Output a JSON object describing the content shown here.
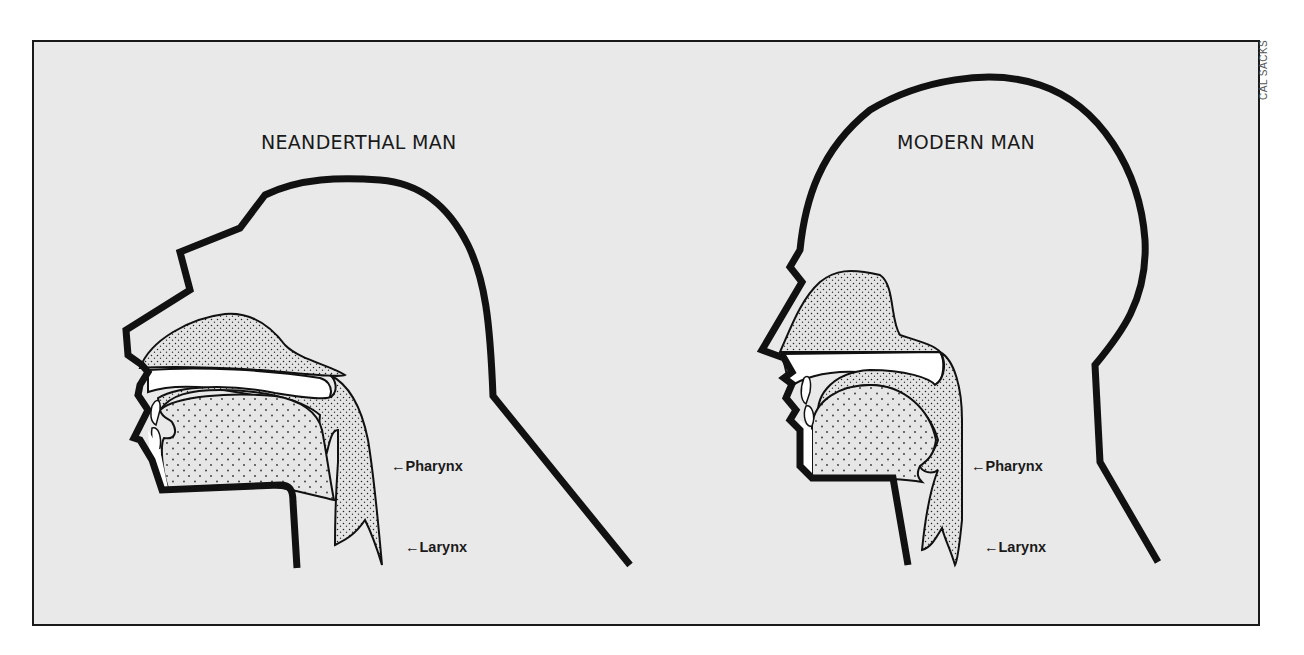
{
  "figure": {
    "credit": "CAL SACKS",
    "background_color": "#e9e9e9",
    "outline_color": "#111111"
  },
  "panels": [
    {
      "id": "neanderthal",
      "title": "NEANDERTHAL MAN",
      "labels": [
        {
          "arrow": "←",
          "text": "Pharynx"
        },
        {
          "arrow": "←",
          "text": "Larynx"
        }
      ]
    },
    {
      "id": "modern",
      "title": "MODERN MAN",
      "labels": [
        {
          "arrow": "←",
          "text": "Pharynx"
        },
        {
          "arrow": "←",
          "text": "Larynx"
        }
      ]
    }
  ]
}
